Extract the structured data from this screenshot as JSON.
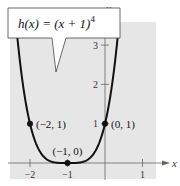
{
  "chart_data": {
    "type": "line",
    "title": "",
    "function_label": "h(x) = (x + 1)",
    "function_exponent": "4",
    "xlabel": "x",
    "ylabel": "y",
    "xlim": [
      -2.5,
      1.3
    ],
    "ylim": [
      -0.35,
      3.7
    ],
    "grid": false,
    "x_ticks": [
      {
        "value": -2,
        "label": "-2"
      },
      {
        "value": -1,
        "label": "-1"
      },
      {
        "value": 1,
        "label": "1"
      }
    ],
    "y_ticks": [
      {
        "value": 1,
        "label": "1"
      },
      {
        "value": 2,
        "label": "2"
      },
      {
        "value": 3,
        "label": "3"
      }
    ],
    "series": [
      {
        "name": "h(x) = (x + 1)^4",
        "expression": "(x+1)^4",
        "x_range": [
          -2.4,
          0.35
        ]
      }
    ],
    "points": [
      {
        "x": -2,
        "y": 1,
        "label": "(-2, 1)",
        "label_side": "right"
      },
      {
        "x": -1,
        "y": 0,
        "label": "(-1, 0)",
        "label_side": "above"
      },
      {
        "x": 0,
        "y": 1,
        "label": "(0, 1)",
        "label_side": "right"
      }
    ],
    "colors": {
      "background": "#e6e6e6",
      "curve": "#111111",
      "axis": "#666666"
    }
  }
}
